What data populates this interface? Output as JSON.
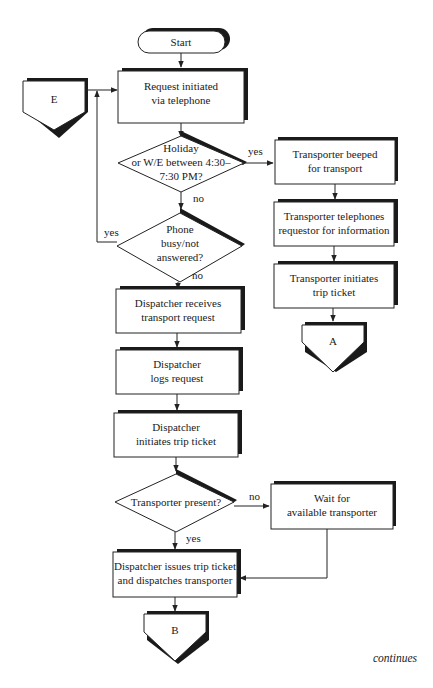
{
  "diagram": {
    "type": "flowchart",
    "page_note": "continues",
    "start": {
      "label": "Start"
    },
    "connectors": {
      "E": {
        "label": "E"
      },
      "A": {
        "label": "A"
      },
      "B": {
        "label": "B"
      }
    },
    "processes": {
      "request": {
        "line1": "Request initiated",
        "line2": "via telephone"
      },
      "beeped": {
        "line1": "Transporter beeped",
        "line2": "for transport"
      },
      "telephones": {
        "line1": "Transporter telephones",
        "line2": "requestor for information"
      },
      "t_initiates": {
        "line1": "Transporter initiates",
        "line2": "trip ticket"
      },
      "receives": {
        "line1": "Dispatcher receives",
        "line2": "transport request"
      },
      "logs": {
        "line1": "Dispatcher",
        "line2": "logs request"
      },
      "d_initiates": {
        "line1": "Dispatcher",
        "line2": "initiates trip ticket"
      },
      "wait": {
        "line1": "Wait for",
        "line2": "available transporter"
      },
      "issues": {
        "line1": "Dispatcher issues trip ticket",
        "line2": "and dispatches transporter"
      }
    },
    "decisions": {
      "holiday": {
        "line1": "Holiday",
        "line2": "or W/E between 4:30–",
        "line3": "7:30 PM?",
        "yes": "yes",
        "no": "no"
      },
      "phone": {
        "line1": "Phone",
        "line2": "busy/not",
        "line3": "answered?",
        "yes": "yes",
        "no": "no"
      },
      "present": {
        "line1": "Transporter present?",
        "yes": "yes",
        "no": "no"
      }
    },
    "edges": [
      [
        "Start",
        "Request initiated via telephone"
      ],
      [
        "E",
        "Request initiated via telephone"
      ],
      [
        "Request initiated via telephone",
        "Holiday or W/E between 4:30–7:30 PM?"
      ],
      [
        "Holiday or W/E between 4:30–7:30 PM?",
        "Transporter beeped for transport",
        "yes"
      ],
      [
        "Holiday or W/E between 4:30–7:30 PM?",
        "Phone busy/not answered?",
        "no"
      ],
      [
        "Phone busy/not answered?",
        "Request initiated via telephone",
        "yes"
      ],
      [
        "Phone busy/not answered?",
        "Dispatcher receives transport request",
        "no"
      ],
      [
        "Transporter beeped for transport",
        "Transporter telephones requestor for information"
      ],
      [
        "Transporter telephones requestor for information",
        "Transporter initiates trip ticket"
      ],
      [
        "Transporter initiates trip ticket",
        "A"
      ],
      [
        "Dispatcher receives transport request",
        "Dispatcher logs request"
      ],
      [
        "Dispatcher logs request",
        "Dispatcher initiates trip ticket"
      ],
      [
        "Dispatcher initiates trip ticket",
        "Transporter present?"
      ],
      [
        "Transporter present?",
        "Wait for available transporter",
        "no"
      ],
      [
        "Transporter present?",
        "Dispatcher issues trip ticket and dispatches transporter",
        "yes"
      ],
      [
        "Wait for available transporter",
        "Dispatcher issues trip ticket and dispatches transporter"
      ],
      [
        "Dispatcher issues trip ticket and dispatches transporter",
        "B"
      ]
    ]
  }
}
